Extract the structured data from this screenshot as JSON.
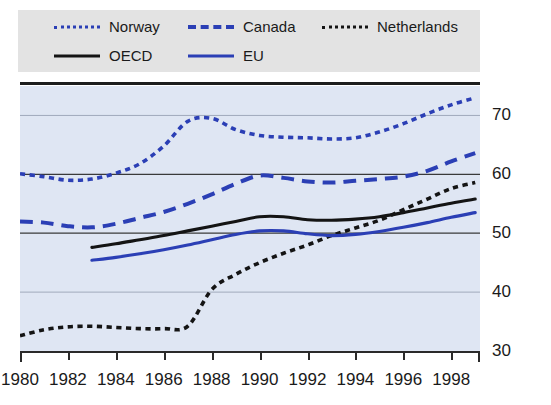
{
  "figure": {
    "cropped_title_fragment": "",
    "background_color": "#ffffff",
    "plot_background_color": "#dfe6f3",
    "legend_background_color": "#e3e3e3"
  },
  "legend": {
    "entries": [
      {
        "label": "Norway",
        "style": "dotted",
        "color": "#2b3fb5",
        "row": 1,
        "col": 1
      },
      {
        "label": "Canada",
        "style": "dashed",
        "color": "#2b3fb5",
        "row": 1,
        "col": 2
      },
      {
        "label": "Netherlands",
        "style": "dotted",
        "color": "#141414",
        "row": 1,
        "col": 3
      },
      {
        "label": "OECD",
        "style": "solid",
        "color": "#141414",
        "row": 2,
        "col": 1
      },
      {
        "label": "EU",
        "style": "solid",
        "color": "#2b3fb5",
        "row": 2,
        "col": 2
      }
    ]
  },
  "chart_data": {
    "type": "line",
    "title": "",
    "xlabel": "",
    "ylabel": "",
    "xlim": [
      1980,
      1999.2
    ],
    "ylim": [
      30,
      75
    ],
    "yticks": [
      30,
      40,
      50,
      60,
      70
    ],
    "ytick_labels": [
      "30",
      "40",
      "50",
      "60",
      "70"
    ],
    "xticks": [
      1980,
      1982,
      1984,
      1986,
      1988,
      1990,
      1992,
      1994,
      1996,
      1998
    ],
    "xtick_labels": [
      "1980",
      "1982",
      "1984",
      "1986",
      "1988",
      "1990",
      "1992",
      "1994",
      "1996",
      "1998"
    ],
    "grid": true,
    "grid_axis": "y",
    "legend_position": "top",
    "series": [
      {
        "name": "Norway",
        "color": "#2b3fb5",
        "style": "dotted",
        "x": [
          1980,
          1981,
          1982,
          1983,
          1984,
          1985,
          1986,
          1987,
          1988,
          1989,
          1990,
          1991,
          1992,
          1993,
          1994,
          1995,
          1996,
          1997,
          1998,
          1999
        ],
        "values": [
          60.1,
          59.6,
          59.0,
          59.2,
          60.2,
          61.8,
          64.8,
          69.0,
          69.5,
          67.6,
          66.6,
          66.3,
          66.2,
          66.0,
          66.2,
          67.2,
          68.6,
          70.3,
          71.8,
          73.0
        ]
      },
      {
        "name": "Canada",
        "color": "#2b3fb5",
        "style": "dashed",
        "x": [
          1980,
          1981,
          1982,
          1983,
          1984,
          1985,
          1986,
          1987,
          1988,
          1989,
          1990,
          1991,
          1992,
          1993,
          1994,
          1995,
          1996,
          1997,
          1998,
          1999
        ],
        "values": [
          52.0,
          51.8,
          51.2,
          51.0,
          51.6,
          52.6,
          53.6,
          55.0,
          56.6,
          58.4,
          59.8,
          59.4,
          58.8,
          58.6,
          58.9,
          59.2,
          59.6,
          60.6,
          62.2,
          63.6
        ]
      },
      {
        "name": "Netherlands",
        "color": "#141414",
        "style": "dotted",
        "x": [
          1980,
          1981,
          1982,
          1983,
          1984,
          1985,
          1986,
          1987,
          1988,
          1989,
          1990,
          1991,
          1992,
          1993,
          1994,
          1995,
          1996,
          1997,
          1998,
          1999
        ],
        "values": [
          32.6,
          33.6,
          34.1,
          34.2,
          34.0,
          33.8,
          33.8,
          34.2,
          40.4,
          43.0,
          45.0,
          46.6,
          48.0,
          49.6,
          50.9,
          52.2,
          54.0,
          55.8,
          57.6,
          58.6
        ]
      },
      {
        "name": "OECD",
        "color": "#141414",
        "style": "solid",
        "x": [
          1983,
          1984,
          1985,
          1986,
          1987,
          1988,
          1989,
          1990,
          1991,
          1992,
          1993,
          1994,
          1995,
          1996,
          1997,
          1998,
          1999
        ],
        "values": [
          47.6,
          48.2,
          48.9,
          49.6,
          50.4,
          51.2,
          52.0,
          52.8,
          52.8,
          52.3,
          52.2,
          52.4,
          52.8,
          53.5,
          54.3,
          55.1,
          55.8
        ]
      },
      {
        "name": "EU",
        "color": "#2b3fb5",
        "style": "solid",
        "x": [
          1983,
          1984,
          1985,
          1986,
          1987,
          1988,
          1989,
          1990,
          1991,
          1992,
          1993,
          1994,
          1995,
          1996,
          1997,
          1998,
          1999
        ],
        "values": [
          45.4,
          45.9,
          46.5,
          47.2,
          48.0,
          48.9,
          49.8,
          50.4,
          50.4,
          49.9,
          49.6,
          49.8,
          50.3,
          51.0,
          51.8,
          52.7,
          53.5
        ]
      }
    ]
  }
}
